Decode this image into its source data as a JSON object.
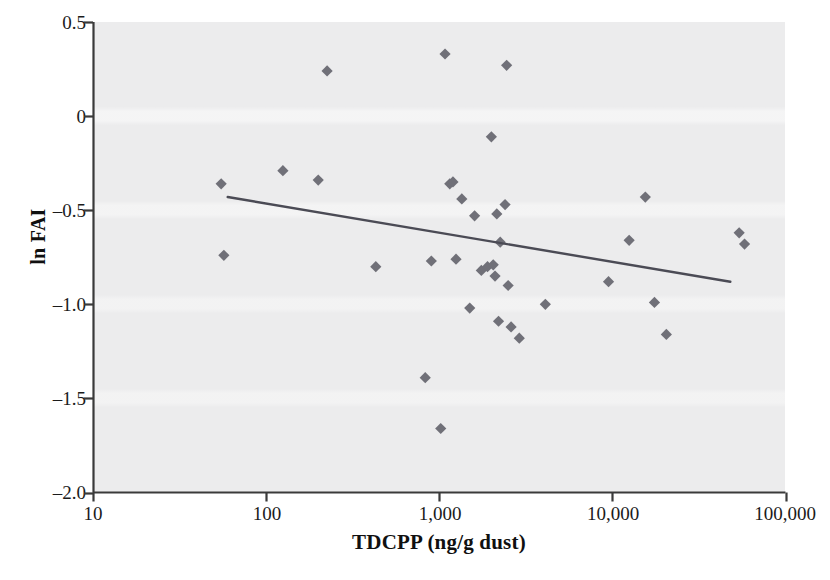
{
  "chart_data": {
    "type": "scatter",
    "title": "",
    "xlabel": "TDCPP (ng/g dust)",
    "ylabel": "ln FAI",
    "x_scale": "log",
    "xlim": [
      10,
      100000
    ],
    "ylim": [
      -2.0,
      0.5
    ],
    "grid": false,
    "legend": null,
    "x_tick_labels": [
      "10",
      "100",
      "1,000",
      "10,000",
      "100,000"
    ],
    "x_tick_values": [
      10,
      100,
      1000,
      10000,
      100000
    ],
    "y_tick_labels": [
      "0.5",
      "0",
      "–0.5",
      "–1.0",
      "–1.5",
      "–2.0"
    ],
    "y_tick_values": [
      0.5,
      0,
      -0.5,
      -1.0,
      -1.5,
      -2.0
    ],
    "marker": "diamond",
    "marker_color": "#707078",
    "points": [
      {
        "x": 55,
        "y": -0.36
      },
      {
        "x": 57,
        "y": -0.74
      },
      {
        "x": 125,
        "y": -0.29
      },
      {
        "x": 200,
        "y": -0.34
      },
      {
        "x": 225,
        "y": 0.24
      },
      {
        "x": 430,
        "y": -0.8
      },
      {
        "x": 830,
        "y": -1.39
      },
      {
        "x": 900,
        "y": -0.77
      },
      {
        "x": 1020,
        "y": -1.66
      },
      {
        "x": 1080,
        "y": 0.33
      },
      {
        "x": 1150,
        "y": -0.36
      },
      {
        "x": 1200,
        "y": -0.35
      },
      {
        "x": 1250,
        "y": -0.76
      },
      {
        "x": 1350,
        "y": -0.44
      },
      {
        "x": 1500,
        "y": -1.02
      },
      {
        "x": 1600,
        "y": -0.53
      },
      {
        "x": 1750,
        "y": -0.82
      },
      {
        "x": 1900,
        "y": -0.8
      },
      {
        "x": 2000,
        "y": -0.11
      },
      {
        "x": 2050,
        "y": -0.79
      },
      {
        "x": 2100,
        "y": -0.85
      },
      {
        "x": 2150,
        "y": -0.52
      },
      {
        "x": 2200,
        "y": -1.09
      },
      {
        "x": 2250,
        "y": -0.67
      },
      {
        "x": 2400,
        "y": -0.47
      },
      {
        "x": 2450,
        "y": 0.27
      },
      {
        "x": 2500,
        "y": -0.9
      },
      {
        "x": 2600,
        "y": -1.12
      },
      {
        "x": 2900,
        "y": -1.18
      },
      {
        "x": 4100,
        "y": -1.0
      },
      {
        "x": 9500,
        "y": -0.88
      },
      {
        "x": 12500,
        "y": -0.66
      },
      {
        "x": 15500,
        "y": -0.43
      },
      {
        "x": 17500,
        "y": -0.99
      },
      {
        "x": 20500,
        "y": -1.16
      },
      {
        "x": 54000,
        "y": -0.62
      },
      {
        "x": 58000,
        "y": -0.68
      }
    ],
    "trendline": {
      "type": "linear-fit",
      "color": "#4b4b55",
      "x_start": 60,
      "y_start": -0.43,
      "x_end": 48000,
      "y_end": -0.88
    }
  },
  "axes": {
    "y_title": "ln FAI",
    "x_title": "TDCPP (ng/g dust)"
  }
}
